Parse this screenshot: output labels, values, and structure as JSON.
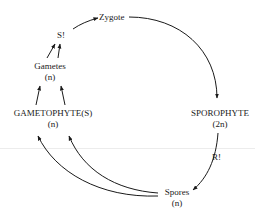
{
  "diagram": {
    "type": "life-cycle",
    "nodes": {
      "zygote": {
        "label": "Zygote"
      },
      "syngamy": {
        "label": "S!"
      },
      "gametes": {
        "label": "Gametes",
        "ploidy": "(n)"
      },
      "gametophyte": {
        "label": "GAMETOPHYTE(S)",
        "ploidy": "(n)"
      },
      "sporophyte": {
        "label": "SPOROPHYTE",
        "ploidy": "(2n)"
      },
      "reduction": {
        "label": "R!"
      },
      "spores": {
        "label": "Spores",
        "ploidy": "(n)"
      }
    },
    "edges": [
      {
        "from": "S!",
        "to": "Zygote"
      },
      {
        "from": "Zygote",
        "to": "SPOROPHYTE"
      },
      {
        "from": "SPOROPHYTE",
        "to": "Spores",
        "via": "R!"
      },
      {
        "from": "Spores",
        "to": "GAMETOPHYTE(S)",
        "count": 2
      },
      {
        "from": "GAMETOPHYTE(S)",
        "to": "Gametes",
        "count": 2
      },
      {
        "from": "Gametes",
        "to": "S!",
        "count": 2
      }
    ],
    "colors": {
      "line": "#1a1a1a",
      "text": "#1a1a1a",
      "background": "#ffffff"
    }
  }
}
